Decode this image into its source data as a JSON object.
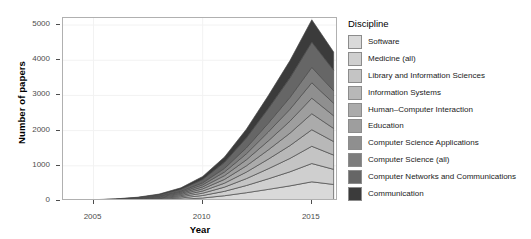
{
  "chart_data": {
    "type": "area",
    "stacked": true,
    "title": "",
    "xlabel": "Year",
    "ylabel": "Number of papers",
    "xlim": [
      2003.6,
      2016.2
    ],
    "ylim": [
      0,
      5200
    ],
    "yticks": [
      0,
      1000,
      2000,
      3000,
      4000,
      5000
    ],
    "ytick_labels": [
      "0",
      "1000",
      "2000",
      "3000",
      "4000",
      "5000"
    ],
    "xticks": [
      2005,
      2010,
      2015
    ],
    "xtick_labels": [
      "2005",
      "2010",
      "2015"
    ],
    "grid": true,
    "legend_position": "right",
    "legend_title": "Discipline",
    "x": [
      2004,
      2005,
      2006,
      2007,
      2008,
      2009,
      2010,
      2011,
      2012,
      2013,
      2014,
      2015,
      2016
    ],
    "series": [
      {
        "name": "Software",
        "color": "#d9d9d9",
        "values": [
          3,
          5,
          8,
          14,
          26,
          48,
          86,
          150,
          235,
          330,
          430,
          545,
          470
        ]
      },
      {
        "name": "Medicine (all)",
        "color": "#cfcfcf",
        "values": [
          2,
          4,
          6,
          11,
          20,
          38,
          70,
          125,
          205,
          300,
          400,
          520,
          430
        ]
      },
      {
        "name": "Library and Information Sciences",
        "color": "#c4c4c4",
        "values": [
          2,
          3,
          6,
          10,
          19,
          36,
          66,
          120,
          195,
          285,
          380,
          490,
          405
        ]
      },
      {
        "name": "Information Systems",
        "color": "#b8b8b8",
        "values": [
          2,
          3,
          5,
          9,
          17,
          33,
          62,
          112,
          185,
          272,
          365,
          470,
          385
        ]
      },
      {
        "name": "Human–Computer Interaction",
        "color": "#ababab",
        "values": [
          2,
          3,
          5,
          9,
          17,
          32,
          60,
          108,
          178,
          263,
          352,
          455,
          372
        ]
      },
      {
        "name": "Education",
        "color": "#9e9e9e",
        "values": [
          2,
          3,
          5,
          9,
          16,
          31,
          58,
          105,
          172,
          255,
          342,
          442,
          360
        ]
      },
      {
        "name": "Computer Science Applications",
        "color": "#8f8f8f",
        "values": [
          2,
          3,
          5,
          9,
          16,
          31,
          58,
          104,
          170,
          252,
          338,
          438,
          356
        ]
      },
      {
        "name": "Computer Science (all)",
        "color": "#7d7d7d",
        "values": [
          2,
          3,
          5,
          9,
          16,
          30,
          57,
          103,
          168,
          250,
          336,
          436,
          354
        ]
      },
      {
        "name": "Computer Networks and Communications",
        "color": "#666666",
        "values": [
          3,
          5,
          8,
          14,
          26,
          50,
          95,
          172,
          282,
          415,
          556,
          718,
          585
        ]
      },
      {
        "name": "Communication",
        "color": "#3b3b3b",
        "values": [
          2,
          4,
          7,
          12,
          23,
          44,
          84,
          151,
          248,
          366,
          490,
          634,
          516
        ]
      }
    ]
  },
  "axes": {
    "y_title": "Number of papers",
    "x_title": "Year"
  },
  "legend": {
    "title": "Discipline",
    "items": [
      {
        "label": "Software",
        "color": "#d9d9d9"
      },
      {
        "label": "Medicine (all)",
        "color": "#cfcfcf"
      },
      {
        "label": "Library and Information Sciences",
        "color": "#c4c4c4"
      },
      {
        "label": "Information Systems",
        "color": "#b8b8b8"
      },
      {
        "label": "Human–Computer Interaction",
        "color": "#ababab"
      },
      {
        "label": "Education",
        "color": "#9e9e9e"
      },
      {
        "label": "Computer Science Applications",
        "color": "#8f8f8f"
      },
      {
        "label": "Computer Science (all)",
        "color": "#7d7d7d"
      },
      {
        "label": "Computer Networks and Communications",
        "color": "#666666"
      },
      {
        "label": "Communication",
        "color": "#3b3b3b"
      }
    ]
  }
}
